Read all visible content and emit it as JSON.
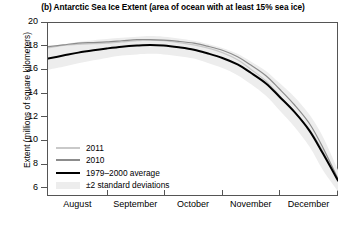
{
  "chart_data": {
    "type": "line",
    "title": "(b) Antarctic Sea Ice Extent (area of ocean with at least 15% sea ice)",
    "xlabel": "",
    "ylabel": "Extent (millions of square kilometers)",
    "ylim": [
      5.4,
      20
    ],
    "yticks": [
      20,
      18,
      16,
      14,
      12,
      10,
      8,
      6
    ],
    "xlim": [
      0,
      153
    ],
    "xtick_labels": [
      "August",
      "September",
      "October",
      "November",
      "December"
    ],
    "xtick_boundaries": [
      31,
      61,
      92,
      122
    ],
    "grid": false,
    "legend_position": "lower-left inside axes",
    "series": [
      {
        "name": "2011",
        "color": "#c9c9c9",
        "x": [
          0,
          8,
          16,
          24,
          31,
          39,
          47,
          54,
          61,
          69,
          77,
          84,
          92,
          100,
          107,
          115,
          122,
          130,
          138,
          145,
          153
        ],
        "values": [
          17.9,
          18.1,
          18.2,
          18.25,
          18.3,
          18.4,
          18.5,
          18.55,
          18.5,
          18.35,
          18.15,
          17.9,
          17.5,
          16.9,
          16.1,
          15.1,
          13.9,
          12.5,
          11.0,
          9.2,
          6.75
        ]
      },
      {
        "name": "2010",
        "color": "#8c8c8c",
        "x": [
          0,
          8,
          16,
          24,
          31,
          39,
          47,
          54,
          61,
          69,
          77,
          84,
          92,
          100,
          107,
          115,
          122,
          130,
          138,
          145,
          153
        ],
        "values": [
          18.0,
          18.15,
          18.3,
          18.35,
          18.4,
          18.5,
          18.6,
          18.6,
          18.55,
          18.45,
          18.3,
          18.05,
          17.7,
          17.15,
          16.45,
          15.55,
          14.45,
          13.1,
          11.5,
          9.5,
          6.85
        ]
      },
      {
        "name": "1979–2000 average",
        "color": "#000000",
        "x": [
          0,
          8,
          16,
          24,
          31,
          39,
          47,
          54,
          61,
          69,
          77,
          84,
          92,
          100,
          107,
          115,
          122,
          130,
          138,
          145,
          153
        ],
        "values": [
          17.0,
          17.25,
          17.5,
          17.7,
          17.85,
          18.0,
          18.1,
          18.15,
          18.1,
          17.95,
          17.75,
          17.45,
          17.05,
          16.5,
          15.8,
          14.9,
          13.8,
          12.5,
          10.9,
          9.0,
          6.7
        ]
      }
    ],
    "band": {
      "name": "±2 standard deviations",
      "color": "#ededed",
      "x": [
        0,
        8,
        16,
        24,
        31,
        39,
        47,
        54,
        61,
        69,
        77,
        84,
        92,
        100,
        107,
        115,
        122,
        130,
        138,
        145,
        153
      ],
      "upper": [
        17.95,
        18.2,
        18.4,
        18.55,
        18.65,
        18.75,
        18.85,
        18.9,
        18.85,
        18.7,
        18.5,
        18.25,
        17.9,
        17.4,
        16.75,
        15.95,
        14.95,
        13.75,
        12.25,
        10.4,
        7.6
      ],
      "lower": [
        16.05,
        16.3,
        16.6,
        16.85,
        17.05,
        17.25,
        17.35,
        17.4,
        17.35,
        17.2,
        17.0,
        16.65,
        16.2,
        15.6,
        14.85,
        13.85,
        12.65,
        11.25,
        9.55,
        7.6,
        5.8
      ]
    }
  },
  "legend": {
    "items": [
      {
        "label": "2011",
        "color": "#c9c9c9",
        "kind": "line"
      },
      {
        "label": "2010",
        "color": "#8c8c8c",
        "kind": "line"
      },
      {
        "label": "1979–2000 average",
        "color": "#000000",
        "kind": "line"
      },
      {
        "label": "±2 standard deviations",
        "color": "#ededed",
        "kind": "band"
      }
    ]
  }
}
